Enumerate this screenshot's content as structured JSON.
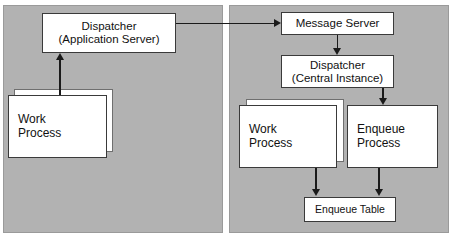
{
  "diagram": {
    "background_color": "#ffffff",
    "panel_color": "#b2b2b2",
    "node_fill": "#ffffff",
    "node_border": "#3a3a3a",
    "arrow_color": "#1a1a1a"
  },
  "panels": {
    "left": {
      "name": "application-server-panel"
    },
    "right": {
      "name": "central-instance-panel"
    }
  },
  "nodes": {
    "dispatcher_app": {
      "line1": "Dispatcher",
      "line2": "(Application Server)"
    },
    "work_process_left": {
      "line1": "Work",
      "line2": "Process"
    },
    "message_server": {
      "line1": "Message Server",
      "line2": ""
    },
    "dispatcher_central": {
      "line1": "Dispatcher",
      "line2": "(Central Instance)"
    },
    "work_process_right": {
      "line1": "Work",
      "line2": "Process"
    },
    "enqueue_process": {
      "line1": "Enqueue",
      "line2": "Process"
    },
    "enqueue_table": {
      "line1": "Enqueue Table",
      "line2": ""
    }
  },
  "arrows": [
    {
      "name": "work-process-to-dispatcher-arrow",
      "direction": "up"
    },
    {
      "name": "dispatcher-app-to-message-server-arrow",
      "direction": "right"
    },
    {
      "name": "message-server-to-dispatcher-central-arrow",
      "direction": "down"
    },
    {
      "name": "dispatcher-central-to-enqueue-process-arrow",
      "direction": "down"
    },
    {
      "name": "work-process-to-enqueue-table-arrow",
      "direction": "down"
    },
    {
      "name": "enqueue-process-to-enqueue-table-arrow",
      "direction": "down"
    }
  ]
}
